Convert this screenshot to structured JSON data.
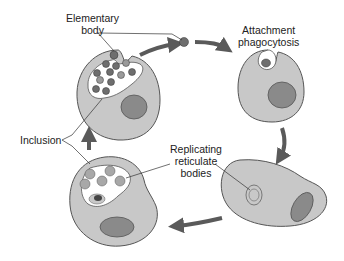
{
  "diagram": {
    "type": "life-cycle",
    "labels": {
      "elementary_body_line1": "Elementary",
      "elementary_body_line2": "body",
      "attachment_line1": "Attachment",
      "attachment_line2": "phagocytosis",
      "replicating_line1": "Replicating",
      "replicating_line2": "reticulate",
      "replicating_line3": "bodies",
      "inclusion": "Inclusion"
    },
    "colors": {
      "cell_fill": "#c8c8c8",
      "cell_stroke": "#555555",
      "nucleus_fill": "#8a8a8a",
      "arrow": "#5a5a5a",
      "inclusion_fill": "#ffffff",
      "body_fill": "#6e6e6e"
    },
    "stages": [
      {
        "name": "elementary-body-release",
        "position": "top-left"
      },
      {
        "name": "attachment-phagocytosis",
        "position": "top-right"
      },
      {
        "name": "reticulate-body-formation",
        "position": "bottom-right"
      },
      {
        "name": "replicating-inclusion",
        "position": "bottom-left"
      }
    ]
  }
}
